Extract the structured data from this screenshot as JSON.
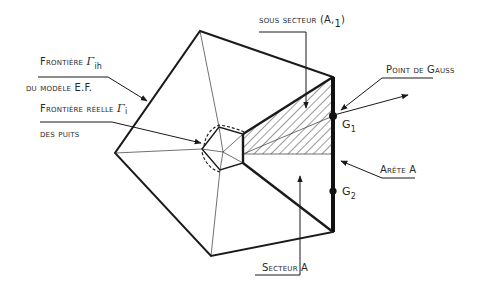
{
  "diagram": {
    "labels": {
      "frontiere_model_line1_prefix": "Frontière ",
      "frontiere_model_symbol": "Γ",
      "frontiere_model_subscript": "ih",
      "frontiere_model_line2": "du modèle E.F.",
      "frontiere_reelle_prefix": "Frontière réelle ",
      "frontiere_reelle_symbol": "Γ",
      "frontiere_reelle_subscript": "i",
      "frontiere_reelle_line2": "des puits",
      "sous_secteur": "sous secteur (A,",
      "sous_secteur_sub": "1",
      "sous_secteur_close": ")",
      "point_de_gauss": "Point de Gauss",
      "g1": "G",
      "g1_sub": "1",
      "g2": "G",
      "g2_sub": "2",
      "arete": "Arête A",
      "secteur": "Secteur A"
    },
    "colors": {
      "line": "#1a1a1a",
      "background": "#ffffff"
    }
  }
}
